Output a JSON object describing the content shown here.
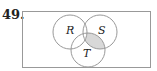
{
  "problem": {
    "number": "49."
  },
  "venn": {
    "sets": [
      {
        "label": "R",
        "cx": 70,
        "cy": 32,
        "r": 17
      },
      {
        "label": "S",
        "cx": 100,
        "cy": 32,
        "r": 17
      },
      {
        "label": "T",
        "cx": 88,
        "cy": 50,
        "r": 17
      }
    ],
    "shaded_region": "(S ∩ T) − R",
    "stroke": "#999999",
    "shade": "#d8d8d8"
  }
}
